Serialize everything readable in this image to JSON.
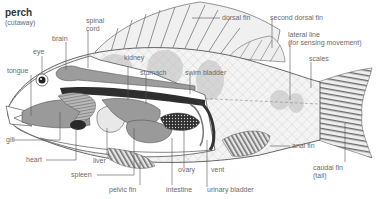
{
  "title": "perch",
  "subtitle": "(cutaway)",
  "labels": {
    "spinal_cord_1": "spinal",
    "spinal_cord_2": "cord",
    "brain": "brain",
    "eye": "eye",
    "tongue": "tongue",
    "gill": "gill",
    "heart": "heart",
    "liver": "liver",
    "spleen": "spleen",
    "pelvic_fin": "pelvic fin",
    "intestine": "intestine",
    "ovary": "ovary",
    "vent": "vent",
    "urinary_bladder": "urinary bladder",
    "kidney": "kidney",
    "stomach": "stomach",
    "swim_bladder": "swim bladder",
    "dorsal_fin": "dorsal fin",
    "second_dorsal_fin": "second dorsal fin",
    "lateral_line_1": "lateral line",
    "lateral_line_2": "(for sensing movement)",
    "scales": "scales",
    "anal_fin": "anal fin",
    "caudal_fin_1": "caudal fin",
    "caudal_fin_2": "(tail)"
  },
  "colors": {
    "organ": "#9a9a9a",
    "dark_organ": "#3a3a3a",
    "body_outline": "#555555",
    "scale_shade": "#d0d0d0",
    "fin_stripe": "#6a6a6a"
  }
}
